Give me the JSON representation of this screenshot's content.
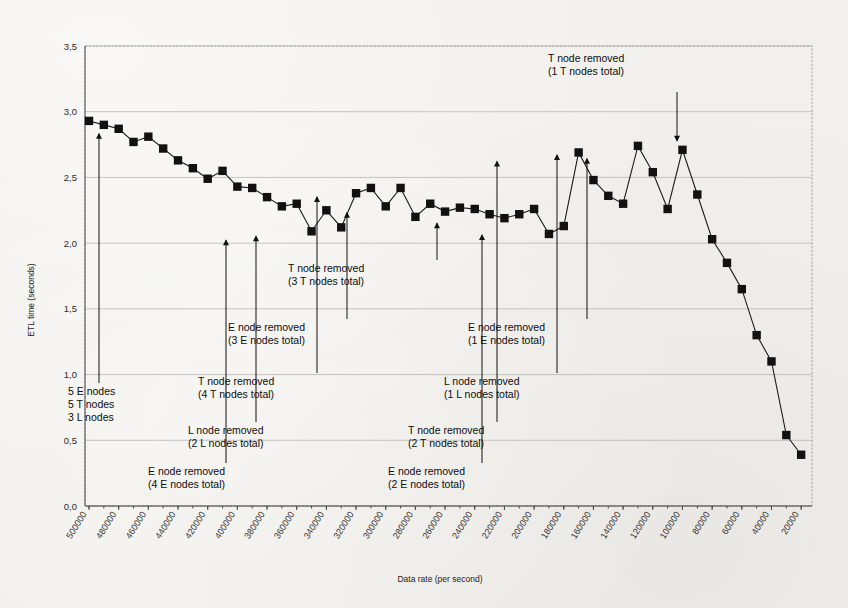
{
  "chart_data": {
    "type": "line",
    "title": "",
    "xlabel": "Data rate (per second)",
    "ylabel": "ETL time (seconds)",
    "ylim": [
      0.0,
      3.5
    ],
    "ytick_labels": [
      "0,0",
      "0,5",
      "1,0",
      "1,5",
      "2,0",
      "2,5",
      "3,0",
      "3,5"
    ],
    "ytick_values": [
      0.0,
      0.5,
      1.0,
      1.5,
      2.0,
      2.5,
      3.0,
      3.5
    ],
    "xtick_labels": [
      "500000",
      "480000",
      "460000",
      "440000",
      "420000",
      "400000",
      "380000",
      "360000",
      "340000",
      "320000",
      "300000",
      "280000",
      "260000",
      "240000",
      "220000",
      "200000",
      "180000",
      "160000",
      "140000",
      "120000",
      "100000",
      "80000",
      "60000",
      "40000",
      "20000"
    ],
    "grid": "horizontal",
    "legend": "none",
    "marker": "square",
    "x": [
      500000,
      490000,
      480000,
      470000,
      460000,
      450000,
      440000,
      430000,
      420000,
      410000,
      400000,
      390000,
      380000,
      370000,
      360000,
      350000,
      340000,
      330000,
      320000,
      310000,
      300000,
      290000,
      280000,
      270000,
      260000,
      250000,
      240000,
      230000,
      220000,
      210000,
      200000,
      190000,
      180000,
      170000,
      160000,
      150000,
      140000,
      130000,
      120000,
      110000,
      100000,
      90000,
      80000,
      70000,
      60000,
      50000,
      40000,
      30000,
      20000
    ],
    "values": [
      2.93,
      2.9,
      2.87,
      2.77,
      2.81,
      2.72,
      2.63,
      2.57,
      2.49,
      2.55,
      2.43,
      2.42,
      2.35,
      2.28,
      2.3,
      2.09,
      2.25,
      2.12,
      2.38,
      2.42,
      2.28,
      2.42,
      2.2,
      2.3,
      2.24,
      2.27,
      2.26,
      2.22,
      2.19,
      2.22,
      2.26,
      2.07,
      2.13,
      2.69,
      2.48,
      2.36,
      2.3,
      2.74,
      2.54,
      2.26,
      2.71,
      2.37,
      2.03,
      1.85,
      1.65,
      1.3,
      1.1,
      0.54,
      0.39
    ],
    "annotations": [
      {
        "name": "initial-config",
        "lines": [
          "5 E nodes",
          "5 T nodes",
          "3 L nodes"
        ],
        "point_index": 1,
        "direction": "up"
      },
      {
        "name": "e-node-4",
        "lines": [
          "E node removed",
          "(4 E nodes total)"
        ],
        "point_index": 15,
        "direction": "up"
      },
      {
        "name": "l-node-2",
        "lines": [
          "L node removed",
          "(2 L nodes total)"
        ],
        "point_index": 17,
        "direction": "up"
      },
      {
        "name": "t-node-4",
        "lines": [
          "T node removed",
          "(4 T nodes total)"
        ],
        "point_index": 21,
        "direction": "up"
      },
      {
        "name": "e-node-3",
        "lines": [
          "E node removed",
          "(3 E nodes total)"
        ],
        "point_index": 23,
        "direction": "up"
      },
      {
        "name": "t-node-3",
        "lines": [
          "T node removed",
          "(3 T nodes total)"
        ],
        "point_index": 29,
        "direction": "up"
      },
      {
        "name": "e-node-2",
        "lines": [
          "E node removed",
          "(2 E nodes total)"
        ],
        "point_index": 32,
        "direction": "up"
      },
      {
        "name": "t-node-2",
        "lines": [
          "T node removed",
          "(2 T nodes total)"
        ],
        "point_index": 33,
        "direction": "up"
      },
      {
        "name": "l-node-1",
        "lines": [
          "L node removed",
          "(1 L nodes total)"
        ],
        "point_index": 37,
        "direction": "up"
      },
      {
        "name": "e-node-1",
        "lines": [
          "E node removed",
          "(1 E nodes total)"
        ],
        "point_index": 40,
        "direction": "up"
      },
      {
        "name": "t-node-1",
        "lines": [
          "T node removed",
          "(1 T nodes total)"
        ],
        "point_index": 40,
        "direction": "down"
      }
    ]
  }
}
